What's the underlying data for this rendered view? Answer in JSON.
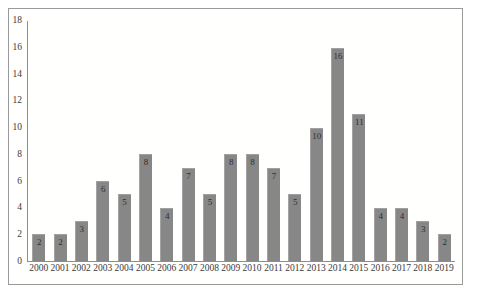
{
  "chart_data": {
    "type": "bar",
    "title": "",
    "subtitle": "",
    "xlabel": "",
    "ylabel": "",
    "categories": [
      "2000",
      "2001",
      "2002",
      "2003",
      "2004",
      "2005",
      "2006",
      "2007",
      "2008",
      "2009",
      "2010",
      "2011",
      "2012",
      "2013",
      "2014",
      "2015",
      "2016",
      "2017",
      "2018",
      "2019"
    ],
    "values": [
      2,
      2,
      3,
      6,
      5,
      8,
      4,
      7,
      5,
      8,
      8,
      7,
      5,
      10,
      16,
      11,
      4,
      4,
      3,
      2
    ],
    "value_labels": [
      "2",
      "2",
      "3",
      "6",
      "5",
      "8",
      "4",
      "7",
      "5",
      "8",
      "8",
      "7",
      "5",
      "10",
      "16",
      "11",
      "4",
      "4",
      "3",
      "2"
    ],
    "ylim": [
      0,
      18
    ],
    "ytick_values": [
      0,
      2,
      4,
      6,
      8,
      10,
      12,
      14,
      16,
      18
    ],
    "ytick_labels": [
      "0",
      "2",
      "4",
      "6",
      "8",
      "10",
      "12",
      "14",
      "16",
      "18"
    ],
    "grid": false,
    "legend": false,
    "legend_position": "none",
    "bar_color": "#878787",
    "axis_color": "#8d8d8d",
    "frame_color": "#9a9a9a",
    "label_color": "#2e2e2e",
    "background": "#ffffff"
  }
}
